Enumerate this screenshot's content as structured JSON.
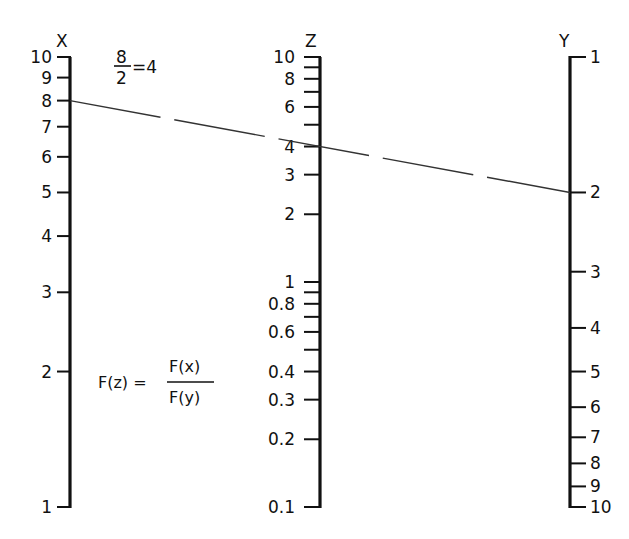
{
  "formula": {
    "lhs": "F(z) =",
    "numerator": "F(x)",
    "denominator": "F(y)"
  },
  "example": {
    "numerator": "8",
    "denominator": "2",
    "result": "=4"
  },
  "axes": {
    "x": {
      "name": "X",
      "scale": "log",
      "range": [
        1,
        10
      ],
      "direction": "up",
      "labels": [
        "10",
        "9",
        "8",
        "7",
        "6",
        "5",
        "4",
        "3",
        "2",
        "1"
      ],
      "values": [
        10,
        9,
        8,
        7,
        6,
        5,
        4,
        3,
        2,
        1
      ]
    },
    "z": {
      "name": "Z",
      "scale": "log",
      "range": [
        0.1,
        10
      ],
      "direction": "up",
      "labels": [
        "10",
        "8",
        "6",
        "4",
        "3",
        "2",
        "1",
        "0.8",
        "0.6",
        "0.4",
        "0.3",
        "0.2",
        "0.1"
      ],
      "values": [
        10,
        8,
        6,
        4,
        3,
        2,
        1,
        0.8,
        0.6,
        0.4,
        0.3,
        0.2,
        0.1
      ],
      "minor_ticks": [
        9,
        7,
        5,
        0.9,
        0.7,
        0.5
      ]
    },
    "y": {
      "name": "Y",
      "scale": "log",
      "range": [
        1,
        10
      ],
      "direction": "down",
      "labels": [
        "1",
        "2",
        "3",
        "4",
        "5",
        "6",
        "7",
        "8",
        "9",
        "10"
      ],
      "values": [
        1,
        2,
        3,
        4,
        5,
        6,
        7,
        8,
        9,
        10
      ]
    }
  },
  "isopleth": {
    "x_value": 8,
    "y_value": 2,
    "z_value": 4,
    "style": "dashed"
  },
  "colors": {
    "ink": "#111111",
    "background": "#ffffff",
    "isopleth": "#333333"
  }
}
